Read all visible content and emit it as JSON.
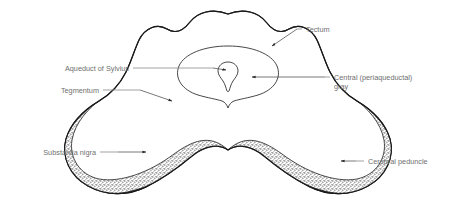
{
  "figure": {
    "background_color": "#ffffff",
    "line_color": "#1a1a1a",
    "label_color": "#6f6f6f",
    "peduncle_fill": "#3a3a3a",
    "substantia_nigra_fill": "#d9d9d9"
  },
  "labels": {
    "tectum": "Tectum",
    "central_gray_line1": "Central (periaqueductal)",
    "central_gray_line2": "gray",
    "aqueduct": "Aqueduct of Sylvius",
    "tegmentum": "Tegmentum",
    "substantia_nigra": "Substantia nigra",
    "cerebral_peduncle": "Cerebral peduncle"
  }
}
